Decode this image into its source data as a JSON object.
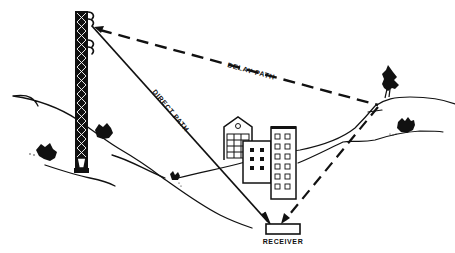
{
  "diagram": {
    "labels": {
      "delay_path": "DELAY PATH",
      "direct_path": "DIRECT PATH",
      "receiver": "RECEIVER"
    },
    "elements": {
      "transmitter": "lattice-tower-with-antennas",
      "buildings": [
        "house-gabled",
        "office-small",
        "office-tall"
      ],
      "trees": [
        "tree-on-right-hill"
      ],
      "bushes": [
        "bush-left-hillside",
        "bush-at-tower",
        "bush-mid-valley",
        "bush-right-hill"
      ]
    },
    "colors": {
      "ink": "#111111",
      "background": "#ffffff"
    }
  }
}
